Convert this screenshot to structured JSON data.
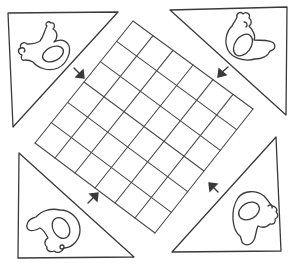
{
  "game": {
    "title": "Hen game board",
    "board_type": "diamond grid",
    "grid": {
      "rows": 6,
      "cols": 6
    },
    "colors": {
      "ink": "#3a3a3a",
      "paper": "#ffffff"
    }
  },
  "bases": [
    {
      "id": "top-left",
      "icon": "hen-icon",
      "arrow": "arrow-down-right-icon"
    },
    {
      "id": "top-right",
      "icon": "hen-icon",
      "arrow": "arrow-down-left-icon"
    },
    {
      "id": "bottom-left",
      "icon": "hen-icon",
      "arrow": "arrow-up-right-icon"
    },
    {
      "id": "bottom-right",
      "icon": "hen-icon",
      "arrow": "arrow-up-left-icon"
    }
  ]
}
